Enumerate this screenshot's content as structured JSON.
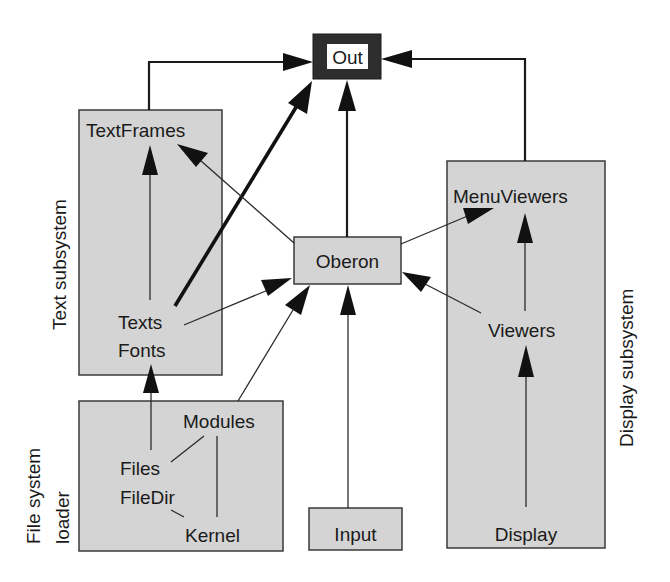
{
  "diagram": {
    "type": "module-dependency-graph",
    "colors": {
      "box_fill": "#d4d4d4",
      "box_border": "#3a3a3a",
      "out_frame": "#2e2e2e",
      "arrow": "#111111",
      "background": "#ffffff"
    },
    "groups": {
      "text": {
        "label": "Text subsystem",
        "modules": [
          "TextFrames",
          "Texts",
          "Fonts"
        ]
      },
      "display": {
        "label": "Display subsystem",
        "modules": [
          "MenuViewers",
          "Viewers",
          "Display"
        ]
      },
      "file": {
        "label_line1": "File system",
        "label_line2": "loader",
        "modules": [
          "Modules",
          "Files",
          "FileDir",
          "Kernel"
        ]
      }
    },
    "nodes": {
      "out": "Out",
      "oberon": "Oberon",
      "input": "Input",
      "textframes": "TextFrames",
      "texts": "Texts",
      "fonts": "Fonts",
      "menuviewers": "MenuViewers",
      "viewers": "Viewers",
      "display": "Display",
      "modules": "Modules",
      "files": "Files",
      "filedir": "FileDir",
      "kernel": "Kernel"
    },
    "edges": [
      {
        "from": "Text subsystem",
        "to": "Out",
        "style": "medium"
      },
      {
        "from": "Display subsystem",
        "to": "Out",
        "style": "medium"
      },
      {
        "from": "Texts",
        "to": "Out",
        "style": "thick"
      },
      {
        "from": "Oberon",
        "to": "Out",
        "style": "medium"
      },
      {
        "from": "Oberon",
        "to": "TextFrames",
        "style": "thin"
      },
      {
        "from": "Oberon",
        "to": "MenuViewers",
        "style": "thin"
      },
      {
        "from": "Texts",
        "to": "TextFrames",
        "style": "thin"
      },
      {
        "from": "Texts",
        "to": "Oberon",
        "style": "thin"
      },
      {
        "from": "Modules",
        "to": "Oberon",
        "style": "thin"
      },
      {
        "from": "Input",
        "to": "Oberon",
        "style": "thin"
      },
      {
        "from": "Viewers",
        "to": "Oberon",
        "style": "thin"
      },
      {
        "from": "Viewers",
        "to": "MenuViewers",
        "style": "thin"
      },
      {
        "from": "Display",
        "to": "Viewers",
        "style": "thin"
      },
      {
        "from": "Files",
        "to": "Fonts",
        "style": "thin"
      },
      {
        "from": "Files",
        "to": "Modules",
        "style": "line"
      },
      {
        "from": "FileDir",
        "to": "Kernel",
        "style": "line"
      },
      {
        "from": "Kernel",
        "to": "Modules",
        "style": "line"
      }
    ]
  }
}
